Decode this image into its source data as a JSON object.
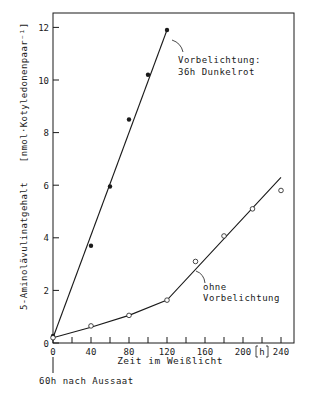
{
  "chart_data": {
    "type": "line",
    "title": "",
    "xlabel": "Zeit im Weißlicht",
    "xunit": "[h]",
    "ylabel": "5-Aminolävulinatgehalt",
    "yunit": "[nmol·Kotyledonenpaar⁻¹]",
    "xlim": [
      0,
      250
    ],
    "ylim": [
      0,
      12.6
    ],
    "x_ticks_major": [
      0,
      40,
      80,
      120,
      160,
      200,
      240
    ],
    "x_ticks_minor": [
      20,
      60,
      100,
      140,
      180,
      220
    ],
    "y_ticks": [
      0,
      2,
      4,
      6,
      8,
      10,
      12
    ],
    "grid": false,
    "legend": "none (inline annotations)",
    "series": [
      {
        "name": "Vorbelichtung: 36h Dunkelrot",
        "marker": "filled-circle",
        "points": [
          [
            0,
            0.27
          ],
          [
            40,
            3.7
          ],
          [
            60,
            5.95
          ],
          [
            80,
            8.5
          ],
          [
            100,
            10.2
          ],
          [
            120,
            11.9
          ]
        ],
        "fit_line": [
          [
            0,
            0.2
          ],
          [
            120,
            11.9
          ]
        ]
      },
      {
        "name": "ohne Vorbelichtung",
        "marker": "open-circle",
        "points": [
          [
            0,
            0.2
          ],
          [
            40,
            0.65
          ],
          [
            80,
            1.05
          ],
          [
            120,
            1.63
          ],
          [
            150,
            3.1
          ],
          [
            180,
            4.07
          ],
          [
            210,
            5.1
          ],
          [
            240,
            5.8
          ]
        ],
        "fit_line": [
          [
            0,
            0.2
          ],
          [
            40,
            0.6
          ],
          [
            80,
            1.05
          ],
          [
            120,
            1.63
          ],
          [
            240,
            6.3
          ]
        ]
      }
    ],
    "annotations": [
      {
        "text": [
          "Vorbelichtung:",
          "36h Dunkelrot"
        ],
        "near_series": 0
      },
      {
        "text": [
          "ohne",
          "Vorbelichtung"
        ],
        "near_series": 1
      },
      {
        "text": [
          "60h nach Aussaat"
        ],
        "at_x": 0,
        "below_axis": true
      }
    ]
  },
  "labels": {
    "annotation_dark_red_line1": "Vorbelichtung:",
    "annotation_dark_red_line2": "36h Dunkelrot",
    "annotation_none_line1": "ohne",
    "annotation_none_line2": "Vorbelichtung",
    "origin_note": "60h nach Aussaat",
    "x_unit": "h"
  },
  "colors": {
    "ink": "#1a1a1a",
    "background": "#ffffff"
  }
}
